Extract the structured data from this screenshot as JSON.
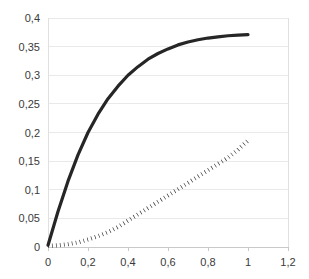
{
  "chart_data": {
    "type": "line",
    "title": "",
    "subtitle": "",
    "xlabel": "",
    "ylabel": "",
    "xlim": [
      0,
      1.2
    ],
    "ylim": [
      0,
      0.4
    ],
    "grid": true,
    "grid_axis": "y",
    "legend": null,
    "legend_position": "none",
    "decimal_separator": ",",
    "x_ticks": [
      0,
      0.2,
      0.4,
      0.6,
      0.8,
      1,
      1.2
    ],
    "x_tick_labels": [
      "0",
      "0,2",
      "0,4",
      "0,6",
      "0,8",
      "1",
      "1,2"
    ],
    "y_ticks": [
      0,
      0.05,
      0.1,
      0.15,
      0.2,
      0.25,
      0.3,
      0.35,
      0.4
    ],
    "y_tick_labels": [
      "0",
      "0,05",
      "0,1",
      "0,15",
      "0,2",
      "0,25",
      "0,3",
      "0,35",
      "0,4"
    ],
    "x": [
      0,
      0.05,
      0.1,
      0.15,
      0.2,
      0.25,
      0.3,
      0.35,
      0.4,
      0.45,
      0.5,
      0.55,
      0.6,
      0.65,
      0.7,
      0.75,
      0.8,
      0.85,
      0.9,
      0.95,
      1
    ],
    "series": [
      {
        "name": "solid-curve",
        "style": "solid",
        "color": "#262626",
        "width": 3.2,
        "values": [
          0.003,
          0.062,
          0.115,
          0.161,
          0.2,
          0.232,
          0.259,
          0.281,
          0.3,
          0.315,
          0.328,
          0.338,
          0.346,
          0.353,
          0.358,
          0.362,
          0.365,
          0.367,
          0.369,
          0.37,
          0.371
        ]
      },
      {
        "name": "dotted-curve",
        "style": "dotted",
        "color": "#1f1f1f",
        "width": 4.2,
        "values": [
          0.002,
          0.003,
          0.005,
          0.008,
          0.013,
          0.019,
          0.026,
          0.035,
          0.046,
          0.057,
          0.068,
          0.079,
          0.09,
          0.101,
          0.112,
          0.123,
          0.134,
          0.145,
          0.156,
          0.17,
          0.186
        ]
      }
    ],
    "colors": {
      "background": "#ffffff",
      "gridline": "#e9e9e9",
      "axis": "#e0e0e0",
      "tick_text": "#3a3a3a",
      "series_solid": "#262626",
      "series_dotted": "#1f1f1f"
    }
  }
}
